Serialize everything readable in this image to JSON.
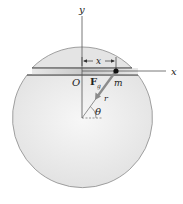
{
  "diagram": {
    "type": "physics-figure",
    "labels": {
      "y_axis": "y",
      "x_axis": "x",
      "origin": "O",
      "mass": "m",
      "force_main": "F",
      "force_sub": "g",
      "radius": "r",
      "angle": "θ",
      "distance": "x"
    },
    "colors": {
      "sphere_fill": "#ececec",
      "sphere_stroke": "#8a8a8a",
      "tunnel_stroke": "#444444",
      "axis_stroke": "#555555",
      "force_arrow": "#8c8c8c",
      "mass_dot": "#111111"
    }
  }
}
